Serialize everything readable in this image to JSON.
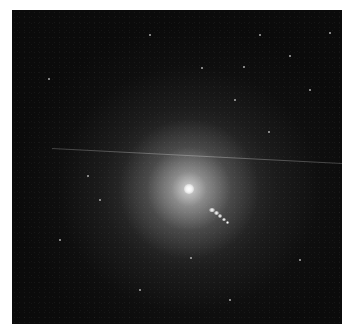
{
  "image": {
    "subject": "elliptical galaxy with bright core and relativistic jet",
    "colors": {
      "background": "#ffffff",
      "sky": "#0b0b0b",
      "core": "#ffffff"
    },
    "core": {
      "x": 189,
      "y": 189
    },
    "jet": {
      "knots": [
        {
          "x": 212,
          "y": 210,
          "w": 6,
          "h": 4
        },
        {
          "x": 216,
          "y": 213,
          "w": 5,
          "h": 4
        },
        {
          "x": 220,
          "y": 216,
          "w": 4,
          "h": 4
        },
        {
          "x": 224,
          "y": 219,
          "w": 4,
          "h": 3
        },
        {
          "x": 227,
          "y": 222,
          "w": 3,
          "h": 3
        }
      ]
    },
    "streak": {
      "x1": 52,
      "y1": 148,
      "x2": 342,
      "y2": 163
    },
    "stars": [
      {
        "x": 260,
        "y": 35
      },
      {
        "x": 290,
        "y": 56
      },
      {
        "x": 202,
        "y": 68
      },
      {
        "x": 244,
        "y": 67
      },
      {
        "x": 269,
        "y": 132
      },
      {
        "x": 330,
        "y": 33
      },
      {
        "x": 49,
        "y": 79
      },
      {
        "x": 88,
        "y": 176
      },
      {
        "x": 191,
        "y": 258
      },
      {
        "x": 100,
        "y": 200
      },
      {
        "x": 310,
        "y": 90
      },
      {
        "x": 150,
        "y": 35
      },
      {
        "x": 235,
        "y": 100
      },
      {
        "x": 140,
        "y": 290
      },
      {
        "x": 60,
        "y": 240
      },
      {
        "x": 300,
        "y": 260
      },
      {
        "x": 230,
        "y": 300
      }
    ]
  }
}
